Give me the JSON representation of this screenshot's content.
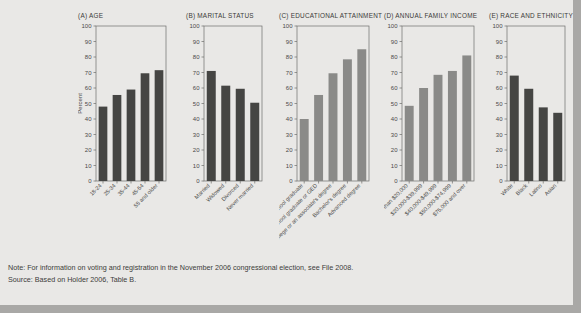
{
  "figure": {
    "background_color": "#e9e8e6",
    "page_shadow_color": "#a9a8a6",
    "dark_bar_color": "#454543",
    "medium_bar_color": "#8a8a88",
    "axis_color": "#6e6e6c"
  },
  "chart_data": [
    {
      "type": "bar",
      "panel_id": "A",
      "title": "(A)  AGE",
      "categories": [
        "18-24",
        "25-34",
        "35-44",
        "45-54",
        "55 and older"
      ],
      "values": [
        48,
        55.5,
        59,
        69.5,
        71.5
      ],
      "xlabel": "",
      "ylabel": "Percent",
      "ylim": [
        0,
        100
      ],
      "yticks": [
        0,
        10,
        20,
        30,
        40,
        50,
        60,
        70,
        80,
        90,
        100
      ],
      "bar_color": "#454543",
      "grid": false
    },
    {
      "type": "bar",
      "panel_id": "B",
      "title": "(B)  MARITAL STATUS",
      "categories": [
        "Married",
        "Widowed",
        "Divorced",
        "Never married"
      ],
      "values": [
        71,
        61.5,
        59.5,
        50.5
      ],
      "xlabel": "",
      "ylabel": "",
      "ylim": [
        0,
        100
      ],
      "yticks": [
        0,
        10,
        20,
        30,
        40,
        50,
        60,
        70,
        80,
        90,
        100
      ],
      "bar_color": "#454543",
      "grid": false
    },
    {
      "type": "bar",
      "panel_id": "C",
      "title": "(C)  EDUCATIONAL ATTAINMENT",
      "categories": [
        "Not a high school graduate",
        "High school graduate or GED",
        "Some college or an associate's degree",
        "Bachelor's degree",
        "Advanced degree"
      ],
      "values": [
        40,
        55.5,
        69.5,
        78.5,
        85
      ],
      "xlabel": "",
      "ylabel": "",
      "ylim": [
        0,
        100
      ],
      "yticks": [
        0,
        10,
        20,
        30,
        40,
        50,
        60,
        70,
        80,
        90,
        100
      ],
      "bar_color": "#8a8a88",
      "grid": false
    },
    {
      "type": "bar",
      "panel_id": "D",
      "title": "(D)  ANNUAL FAMILY INCOME",
      "categories": [
        "Less than $20,000",
        "$20,000-$39,999",
        "$40,000-$49,999",
        "$50,000-$74,999",
        "$75,000 and over"
      ],
      "values": [
        48.5,
        60,
        68.5,
        71,
        81
      ],
      "xlabel": "",
      "ylabel": "",
      "ylim": [
        0,
        100
      ],
      "yticks": [
        0,
        10,
        20,
        30,
        40,
        50,
        60,
        70,
        80,
        90,
        100
      ],
      "bar_color": "#8a8a88",
      "grid": false
    },
    {
      "type": "bar",
      "panel_id": "E",
      "title": "(E)  RACE AND ETHNICITY",
      "categories": [
        "White",
        "Black",
        "Latino",
        "Asian"
      ],
      "values": [
        68,
        59.5,
        47.5,
        44
      ],
      "xlabel": "",
      "ylabel": "",
      "ylim": [
        0,
        100
      ],
      "yticks": [
        0,
        10,
        20,
        30,
        40,
        50,
        60,
        70,
        80,
        90,
        100
      ],
      "bar_color": "#454543",
      "grid": false
    }
  ],
  "footnotes": {
    "note": "Note: For information on voting and registration in the November 2006 congressional election, see File 2008.",
    "source": "Source: Based on Holder 2006, Table B."
  }
}
